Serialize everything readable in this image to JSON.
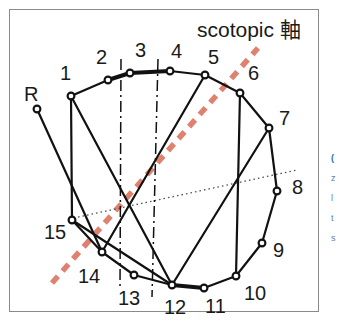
{
  "figure": {
    "title": "scotopic 軸",
    "background_color": "#ffffff",
    "frame_color": "#8a8a8a",
    "edge_fragment_lines": [
      "(",
      "z",
      "l",
      "t",
      "s"
    ]
  },
  "colors": {
    "node_stroke": "#111111",
    "node_fill": "#ffffff",
    "polyline": "#111111",
    "scotopic_axis": "#e0806f",
    "dashdot_line": "#111111",
    "dotted_line": "#555555",
    "label_text": "#1a1a1a"
  },
  "chart_data": {
    "type": "scatter",
    "title": "scotopic 軸",
    "xlabel": "",
    "ylabel": "",
    "xlim": [
      0,
      341
    ],
    "ylim": [
      0,
      324
    ],
    "grid": false,
    "legend": "none",
    "annotations": [
      "scotopic 軸"
    ],
    "point_labels": [
      "R",
      "1",
      "2",
      "3",
      "4",
      "5",
      "6",
      "7",
      "8",
      "9",
      "10",
      "11",
      "12",
      "13",
      "14",
      "15"
    ],
    "points": [
      {
        "label": "R",
        "x": 37,
        "y": 109,
        "label_x": 24,
        "label_y": 84
      },
      {
        "label": "1",
        "x": 71,
        "y": 96,
        "label_x": 60,
        "label_y": 63
      },
      {
        "label": "2",
        "x": 108,
        "y": 80,
        "label_x": 96,
        "label_y": 47
      },
      {
        "label": "3",
        "x": 130,
        "y": 73,
        "label_x": 135,
        "label_y": 40
      },
      {
        "label": "4",
        "x": 170,
        "y": 71,
        "label_x": 171,
        "label_y": 41
      },
      {
        "label": "5",
        "x": 205,
        "y": 75,
        "label_x": 208,
        "label_y": 47
      },
      {
        "label": "6",
        "x": 240,
        "y": 93,
        "label_x": 248,
        "label_y": 63
      },
      {
        "label": "7",
        "x": 269,
        "y": 128,
        "label_x": 279,
        "label_y": 108
      },
      {
        "label": "8",
        "x": 277,
        "y": 191,
        "label_x": 292,
        "label_y": 177
      },
      {
        "label": "9",
        "x": 262,
        "y": 243,
        "label_x": 273,
        "label_y": 240
      },
      {
        "label": "10",
        "x": 236,
        "y": 276,
        "label_x": 244,
        "label_y": 283
      },
      {
        "label": "11",
        "x": 204,
        "y": 288,
        "label_x": 205,
        "label_y": 296
      },
      {
        "label": "12",
        "x": 172,
        "y": 285,
        "label_x": 164,
        "label_y": 297
      },
      {
        "label": "13",
        "x": 134,
        "y": 275,
        "label_x": 118,
        "label_y": 288
      },
      {
        "label": "14",
        "x": 102,
        "y": 252,
        "label_x": 78,
        "label_y": 266
      },
      {
        "label": "15",
        "x": 72,
        "y": 220,
        "label_x": 44,
        "label_y": 222
      }
    ],
    "polyline_segments": [
      {
        "name": "outer-ring-2-3",
        "from": "2",
        "to": "3",
        "thick": true
      },
      {
        "name": "outer-ring-3-4",
        "from": "3",
        "to": "4",
        "thick": true
      },
      {
        "name": "outer-ring-4-5",
        "from": "4",
        "to": "5",
        "thick": false
      },
      {
        "name": "outer-ring-5-6",
        "from": "5",
        "to": "6",
        "thick": false
      },
      {
        "name": "outer-ring-6-7",
        "from": "6",
        "to": "7",
        "thick": false
      },
      {
        "name": "outer-ring-7-8",
        "from": "7",
        "to": "8",
        "thick": false
      },
      {
        "name": "outer-ring-8-9",
        "from": "8",
        "to": "9",
        "thick": false
      },
      {
        "name": "outer-ring-9-10",
        "from": "9",
        "to": "10",
        "thick": false
      },
      {
        "name": "outer-ring-10-11",
        "from": "10",
        "to": "11",
        "thick": false
      },
      {
        "name": "outer-ring-11-12",
        "from": "11",
        "to": "12",
        "thick": true
      },
      {
        "name": "outer-ring-12-13",
        "from": "12",
        "to": "13",
        "thick": false
      },
      {
        "name": "outer-ring-13-14",
        "from": "13",
        "to": "14",
        "thick": false
      },
      {
        "name": "outer-ring-14-15",
        "from": "14",
        "to": "15",
        "thick": false
      },
      {
        "name": "outer-ring-15-1",
        "from": "15",
        "to": "1",
        "thick": false
      },
      {
        "name": "outer-ring-1-2",
        "from": "1",
        "to": "2",
        "thick": false
      },
      {
        "name": "chord-R-14",
        "from": "R",
        "to": "14",
        "thick": false
      },
      {
        "name": "chord-1-12",
        "from": "1",
        "to": "12",
        "thick": false
      },
      {
        "name": "chord-5-14",
        "from": "5",
        "to": "14",
        "thick": false
      },
      {
        "name": "chord-6-10",
        "from": "6",
        "to": "10",
        "thick": false
      },
      {
        "name": "chord-7-12",
        "from": "7",
        "to": "12",
        "thick": false
      },
      {
        "name": "chord-15-12",
        "from": "15",
        "to": "12",
        "thick": false
      }
    ],
    "reference_lines": [
      {
        "name": "scotopic-axis",
        "style": "dashed",
        "color": "#e0806f",
        "x1": 52,
        "y1": 283,
        "x2": 258,
        "y2": 48
      },
      {
        "name": "dotted-axis",
        "style": "dotted",
        "color": "#555555",
        "x1": 69,
        "y1": 219,
        "x2": 297,
        "y2": 170
      },
      {
        "name": "dashdot-left",
        "style": "dashdot",
        "color": "#111111",
        "x1": 121,
        "y1": 59,
        "x2": 120,
        "y2": 289
      },
      {
        "name": "dashdot-right",
        "style": "dashdot",
        "color": "#111111",
        "x1": 158,
        "y1": 59,
        "x2": 152,
        "y2": 297
      }
    ]
  }
}
